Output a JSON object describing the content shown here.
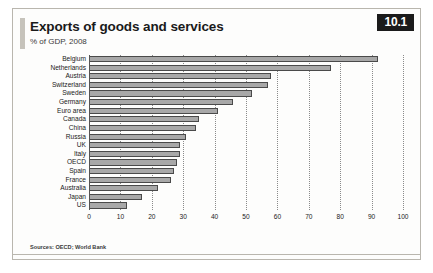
{
  "figure": {
    "badge": "10.1",
    "title": "Exports of goods and services",
    "subtitle": "% of GDP, 2008",
    "source": "Sources: OECD; World Bank"
  },
  "chart_data": {
    "type": "bar",
    "orientation": "horizontal",
    "title": "Exports of goods and services",
    "subtitle": "% of GDP, 2008",
    "xlabel": "",
    "ylabel": "",
    "xlim": [
      0,
      100
    ],
    "xticks": [
      0,
      10,
      20,
      30,
      40,
      50,
      60,
      70,
      80,
      90,
      100
    ],
    "grid": "vertical-dotted",
    "legend": "none",
    "bar_color": "#a8a8a8",
    "bar_edge_color": "#4a4a4a",
    "categories": [
      "Belgium",
      "Netherlands",
      "Austria",
      "Switzerland",
      "Sweden",
      "Germany",
      "Euro area",
      "Canada",
      "China",
      "Russia",
      "UK",
      "Italy",
      "OECD",
      "Spain",
      "France",
      "Australia",
      "Japan",
      "US"
    ],
    "values": [
      92,
      77,
      58,
      57,
      52,
      46,
      41,
      35,
      34,
      31,
      29,
      29,
      28,
      27,
      26,
      22,
      17,
      12
    ]
  }
}
